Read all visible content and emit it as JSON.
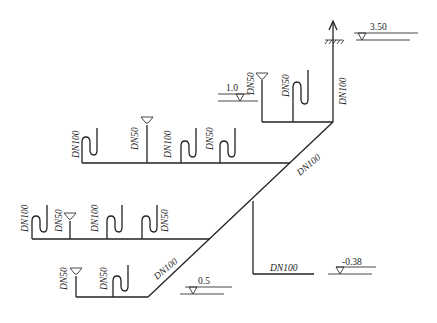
{
  "diagram": {
    "type": "drainage-pipe-isometric",
    "title_caption": "",
    "bottom_caption": "",
    "stack": {
      "label": "DN100",
      "vent_arrow": "up-arrow",
      "ground_symbol": "roof-hatching"
    },
    "levels": [
      {
        "id": "roof",
        "value": "3.50"
      },
      {
        "id": "floor2",
        "value": "1.0"
      },
      {
        "id": "floor1",
        "value": "0.5"
      },
      {
        "id": "outlet",
        "value": "-0.38"
      }
    ],
    "main_pipe": {
      "upper_label": "DN100",
      "lower_label": "DN100"
    },
    "outlet_pipe": {
      "label": "DN100"
    },
    "branches": [
      {
        "id": "branch-top",
        "fixtures": [
          {
            "type": "floor-drain",
            "label": "DN50"
          },
          {
            "type": "s-trap",
            "label": "DN50"
          }
        ]
      },
      {
        "id": "branch-upper-middle",
        "fixtures": [
          {
            "type": "s-trap",
            "label": "DN100"
          },
          {
            "type": "floor-drain",
            "label": "DN50"
          },
          {
            "type": "s-trap",
            "label": "DN100"
          },
          {
            "type": "s-trap",
            "label": "DN50"
          }
        ]
      },
      {
        "id": "branch-lower-middle",
        "fixtures": [
          {
            "type": "s-trap",
            "label": "DN100"
          },
          {
            "type": "floor-drain",
            "label": "DN50"
          },
          {
            "type": "s-trap",
            "label": "DN100"
          },
          {
            "type": "s-trap",
            "label": "DN50"
          }
        ]
      },
      {
        "id": "branch-bottom",
        "fixtures": [
          {
            "type": "floor-drain",
            "label": "DN50"
          },
          {
            "type": "s-trap",
            "label": "DN50"
          }
        ]
      }
    ]
  }
}
